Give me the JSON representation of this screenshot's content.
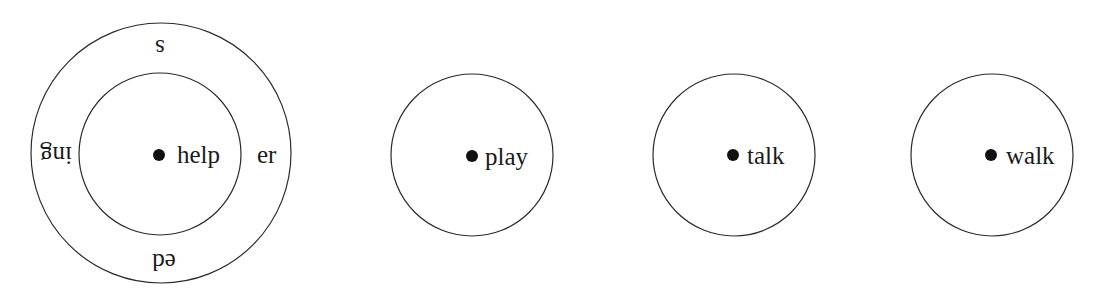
{
  "diagram": {
    "type": "morphology-word-circles",
    "stroke_color": "#2a2a2a",
    "text_color": "#1a1a1a",
    "background": "#ffffff",
    "groups": [
      {
        "id": "help",
        "root": "help",
        "has_outer_ring": true,
        "affixes": {
          "top": "s",
          "right": "er",
          "bottom": "ed",
          "left": "ing"
        }
      },
      {
        "id": "play",
        "root": "play",
        "has_outer_ring": false
      },
      {
        "id": "talk",
        "root": "talk",
        "has_outer_ring": false
      },
      {
        "id": "walk",
        "root": "walk",
        "has_outer_ring": false
      }
    ]
  }
}
